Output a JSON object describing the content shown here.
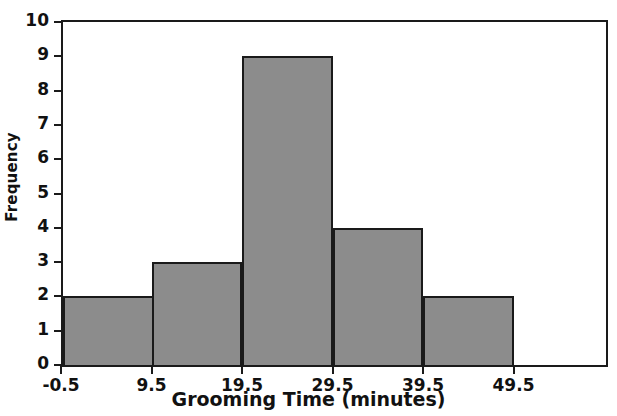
{
  "chart_data": {
    "type": "bar",
    "subtype": "histogram",
    "title": "",
    "xlabel": "Grooming Time (minutes)",
    "ylabel": "Frequency",
    "xlim": [
      -0.5,
      59.5
    ],
    "ylim": [
      0,
      10
    ],
    "grid": false,
    "legend": null,
    "bin_width": 10,
    "bin_edges": [
      -0.5,
      9.5,
      19.5,
      29.5,
      39.5,
      49.5
    ],
    "categories": [
      "-0.5 to 9.5",
      "9.5 to 19.5",
      "19.5 to 29.5",
      "29.5 to 39.5",
      "39.5 to 49.5"
    ],
    "values": [
      2,
      3,
      9,
      4,
      2
    ],
    "bars": [
      {
        "label": "-0.5 to 9.5",
        "start": -0.5,
        "end": 9.5,
        "value": 2
      },
      {
        "label": "9.5 to 19.5",
        "start": 9.5,
        "end": 19.5,
        "value": 3
      },
      {
        "label": "19.5 to 29.5",
        "start": 19.5,
        "end": 29.5,
        "value": 9
      },
      {
        "label": "29.5 to 39.5",
        "start": 29.5,
        "end": 39.5,
        "value": 4
      },
      {
        "label": "39.5 to 49.5",
        "start": 39.5,
        "end": 49.5,
        "value": 2
      }
    ],
    "xticks": [
      -0.5,
      9.5,
      19.5,
      29.5,
      39.5,
      49.5
    ],
    "xtick_labels": [
      "-0.5",
      "9.5",
      "19.5",
      "29.5",
      "39.5",
      "49.5"
    ],
    "yticks": [
      0,
      1,
      2,
      3,
      4,
      5,
      6,
      7,
      8,
      9,
      10
    ],
    "ytick_labels": [
      "0",
      "1",
      "2",
      "3",
      "4",
      "5",
      "6",
      "7",
      "8",
      "9",
      "10"
    ],
    "total_frequency": 20,
    "colors": {
      "bar_fill": "#8c8c8c",
      "bar_edge": "#1a1a1a",
      "axis": "#1a1a1a",
      "text": "#111111",
      "background": "#ffffff"
    }
  }
}
